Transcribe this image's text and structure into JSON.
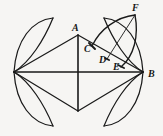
{
  "figure": {
    "background_color": "#f6f5f3",
    "stroke_color": "#1a1a1a",
    "label_color": "#181818",
    "width": 163,
    "height": 136,
    "labels": [
      {
        "id": "A",
        "text": "A",
        "x": 72,
        "y": 23
      },
      {
        "id": "C",
        "text": "C",
        "x": 84,
        "y": 44
      },
      {
        "id": "D",
        "text": "D",
        "x": 99,
        "y": 55
      },
      {
        "id": "E",
        "text": "E",
        "x": 113,
        "y": 62
      },
      {
        "id": "B",
        "text": "B",
        "x": 148,
        "y": 69
      },
      {
        "id": "F",
        "text": "F",
        "x": 132,
        "y": 3
      }
    ],
    "points": {
      "left_vertex": {
        "x": 14,
        "y": 72
      },
      "top_vertex_A": {
        "x": 78,
        "y": 35
      },
      "bottom_vertex": {
        "x": 78,
        "y": 111
      },
      "right_vertex_B": {
        "x": 143,
        "y": 72
      },
      "C": {
        "x": 92,
        "y": 46
      },
      "D": {
        "x": 107,
        "y": 59
      },
      "E": {
        "x": 121,
        "y": 66
      },
      "F": {
        "x": 135,
        "y": 15
      }
    },
    "segments": [
      {
        "name": "left-to-A",
        "from": "left_vertex",
        "to": "top_vertex_A"
      },
      {
        "name": "A-to-B",
        "from": "top_vertex_A",
        "to": "right_vertex_B"
      },
      {
        "name": "left-to-bottom",
        "from": "left_vertex",
        "to": "bottom_vertex"
      },
      {
        "name": "bottom-to-B",
        "from": "bottom_vertex",
        "to": "right_vertex_B"
      },
      {
        "name": "horizontal-diagonal",
        "from": "left_vertex",
        "to": "right_vertex_B"
      },
      {
        "name": "vertical-diagonal",
        "from": "top_vertex_A",
        "to": "bottom_vertex"
      },
      {
        "name": "F-to-D",
        "from": "F",
        "to": "D"
      }
    ],
    "arcs": [
      {
        "name": "petal-top-left-outer"
      },
      {
        "name": "petal-top-left-inner"
      },
      {
        "name": "petal-bottom-left-outer"
      },
      {
        "name": "petal-bottom-left-inner"
      },
      {
        "name": "petal-top-right-outer"
      },
      {
        "name": "petal-top-right-inner"
      },
      {
        "name": "petal-bottom-right-outer"
      },
      {
        "name": "petal-bottom-right-inner"
      },
      {
        "name": "arc-F-through-C"
      },
      {
        "name": "arc-F-through-E"
      }
    ]
  }
}
